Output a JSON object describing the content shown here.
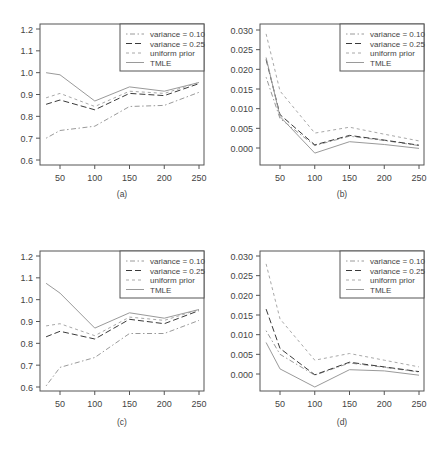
{
  "figure": {
    "panels": [
      "(a)",
      "(b)",
      "(c)",
      "(d)"
    ]
  },
  "legend": [
    "variance = 0.10",
    "variance = 0.25",
    "uniform prior",
    "TMLE"
  ],
  "chart_data": [
    {
      "type": "line",
      "panel_label": "(a)",
      "title": "",
      "xlabel": "",
      "ylabel": "",
      "x": [
        30,
        50,
        100,
        150,
        200,
        250
      ],
      "xticks": [
        50,
        100,
        150,
        200,
        250
      ],
      "yticks": [
        "0.6",
        "0.7",
        "0.8",
        "0.9",
        "1.0",
        "1.1",
        "1.2"
      ],
      "ylim": [
        0.6,
        1.2
      ],
      "legend_position": "top-right",
      "grid": false,
      "series": [
        {
          "name": "variance = 0.10",
          "style": "dotdash",
          "values": [
            0.7,
            0.735,
            0.755,
            0.845,
            0.85,
            0.91
          ]
        },
        {
          "name": "variance = 0.25",
          "style": "longdash",
          "values": [
            0.855,
            0.875,
            0.83,
            0.905,
            0.895,
            0.95
          ]
        },
        {
          "name": "uniform prior",
          "style": "dashed",
          "values": [
            0.885,
            0.905,
            0.845,
            0.915,
            0.905,
            0.955
          ]
        },
        {
          "name": "TMLE",
          "style": "solid",
          "values": [
            1.0,
            0.99,
            0.87,
            0.935,
            0.915,
            0.955
          ]
        }
      ]
    },
    {
      "type": "line",
      "panel_label": "(b)",
      "title": "",
      "xlabel": "",
      "ylabel": "",
      "x": [
        30,
        50,
        100,
        150,
        200,
        250
      ],
      "xticks": [
        50,
        100,
        150,
        200,
        250
      ],
      "yticks": [
        "0.000",
        "0.005",
        "0.010",
        "0.015",
        "0.020",
        "0.025",
        "0.030"
      ],
      "ylim": [
        -0.004,
        0.031
      ],
      "legend_position": "top-right",
      "grid": false,
      "series": [
        {
          "name": "variance = 0.10",
          "style": "dotdash",
          "values": [
            0.018,
            0.0075,
            0.0006,
            0.003,
            0.0019,
            0.0006
          ]
        },
        {
          "name": "variance = 0.25",
          "style": "longdash",
          "values": [
            0.0225,
            0.0085,
            0.0008,
            0.0032,
            0.002,
            0.0007
          ]
        },
        {
          "name": "uniform prior",
          "style": "dashed",
          "values": [
            0.029,
            0.0145,
            0.0038,
            0.0053,
            0.0035,
            0.0018
          ]
        },
        {
          "name": "TMLE",
          "style": "solid",
          "values": [
            0.023,
            0.008,
            -0.0013,
            0.0016,
            0.0009,
            -0.0001
          ]
        }
      ]
    },
    {
      "type": "line",
      "panel_label": "(c)",
      "title": "",
      "xlabel": "",
      "ylabel": "",
      "x": [
        30,
        50,
        100,
        150,
        200,
        250
      ],
      "xticks": [
        50,
        100,
        150,
        200,
        250
      ],
      "yticks": [
        "0.6",
        "0.7",
        "0.8",
        "0.9",
        "1.0",
        "1.1",
        "1.2"
      ],
      "ylim": [
        0.6,
        1.2
      ],
      "legend_position": "top-right",
      "grid": false,
      "series": [
        {
          "name": "variance = 0.10",
          "style": "dotdash",
          "values": [
            0.605,
            0.69,
            0.735,
            0.845,
            0.845,
            0.905
          ]
        },
        {
          "name": "variance = 0.25",
          "style": "longdash",
          "values": [
            0.83,
            0.855,
            0.82,
            0.91,
            0.89,
            0.95
          ]
        },
        {
          "name": "uniform prior",
          "style": "dashed",
          "values": [
            0.88,
            0.89,
            0.835,
            0.92,
            0.905,
            0.955
          ]
        },
        {
          "name": "TMLE",
          "style": "solid",
          "values": [
            1.075,
            1.03,
            0.87,
            0.94,
            0.915,
            0.955
          ]
        }
      ]
    },
    {
      "type": "line",
      "panel_label": "(d)",
      "title": "",
      "xlabel": "",
      "ylabel": "",
      "x": [
        30,
        50,
        100,
        150,
        200,
        250
      ],
      "xticks": [
        50,
        100,
        150,
        200,
        250
      ],
      "yticks": [
        "0.000",
        "0.005",
        "0.010",
        "0.015",
        "0.020",
        "0.025",
        "0.030"
      ],
      "ylim": [
        -0.004,
        0.031
      ],
      "legend_position": "top-right",
      "grid": false,
      "series": [
        {
          "name": "variance = 0.10",
          "style": "dotdash",
          "values": [
            0.011,
            0.005,
            -0.0003,
            0.0028,
            0.0017,
            0.0005
          ]
        },
        {
          "name": "variance = 0.25",
          "style": "longdash",
          "values": [
            0.0165,
            0.0065,
            -0.0002,
            0.003,
            0.0018,
            0.0006
          ]
        },
        {
          "name": "uniform prior",
          "style": "dashed",
          "values": [
            0.028,
            0.014,
            0.0035,
            0.0052,
            0.0035,
            0.0018
          ]
        },
        {
          "name": "TMLE",
          "style": "solid",
          "values": [
            0.008,
            0.0013,
            -0.0033,
            0.0011,
            0.0008,
            -0.0003
          ]
        }
      ]
    }
  ]
}
